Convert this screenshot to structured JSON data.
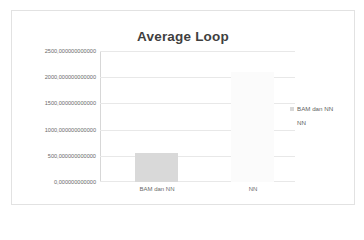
{
  "chart_data": {
    "type": "bar",
    "title": "Average Loop",
    "xlabel": "",
    "ylabel": "",
    "categories": [
      "BAM dan NN",
      "NN"
    ],
    "series": [
      {
        "name": "BAM dan NN",
        "color": "#d9d9d9",
        "values": [
          550000000000,
          0
        ]
      },
      {
        "name": "NN",
        "color": "#fbfbfb",
        "values": [
          0,
          2100000000000
        ]
      }
    ],
    "ylim": [
      0,
      2500000000000
    ],
    "ytick_values": [
      0,
      500000000000,
      1000000000000,
      1500000000000,
      2000000000000,
      2500000000000
    ],
    "ytick_labels": [
      "0,000000000000",
      "500,000000000000",
      "1000,000000000000",
      "1500,000000000000",
      "2000,000000000000",
      "2500,000000000000"
    ],
    "grid": "horizontal",
    "legend_position": "right",
    "legend_entries": [
      {
        "label": "BAM dan NN",
        "color": "#d9d9d9"
      },
      {
        "label": "NN",
        "color": "#fdfdfd"
      }
    ],
    "colors": {
      "title": "#3f3f3f",
      "gridline": "#e8e8e8",
      "axis": "#d7d7d7",
      "tick_text": "#6a6a6a",
      "border": "#e2e2e2",
      "background": "#ffffff"
    }
  }
}
